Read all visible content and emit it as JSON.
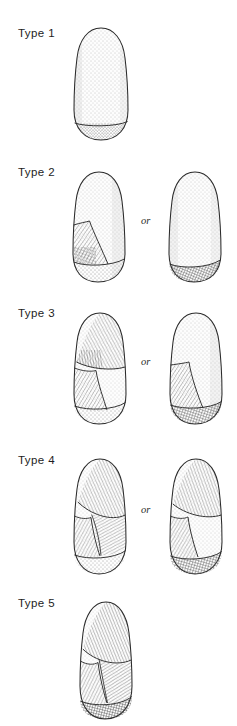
{
  "figure": {
    "background_color": "#ffffff",
    "ink_color": "#1a1a1a",
    "or_text": "or",
    "rows": [
      {
        "label": "Type 1",
        "variant_count": 1,
        "has_or": false,
        "description": "Unmodified ogive-shaped specimen, stippled surface, plain flat base"
      },
      {
        "label": "Type 2",
        "variant_count": 2,
        "has_or": true,
        "description": "Specimen with a single lower-lateral flake scar, or specimen with cross-hatched basal bevel only"
      },
      {
        "label": "Type 3",
        "variant_count": 2,
        "has_or": true,
        "description": "Specimen with upper and lower lateral flake scars, or specimen with one broad lateral flake scar and hatched base"
      },
      {
        "label": "Type 4",
        "variant_count": 2,
        "has_or": true,
        "description": "Specimen extensively flaked across multiple facets on both upper and lower body"
      },
      {
        "label": "Type 5",
        "variant_count": 1,
        "has_or": false,
        "description": "Single specimen, fully flaked over entire surface with dark cross-hatched base"
      }
    ]
  }
}
